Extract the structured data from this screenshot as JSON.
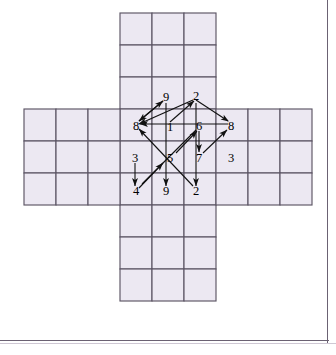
{
  "figure": {
    "name": "cube-net-with-arrows",
    "colors": {
      "cell_fill": "#ece8f2",
      "grid_line": "#5c5564",
      "arrow": "#111111",
      "frame": "#6b6273",
      "background": "#ffffff"
    },
    "grid": {
      "cell_size": 32,
      "origin_x": 24,
      "origin_y": 13,
      "layout_note": "plus/cross shape: 3-wide vertical arm of 9 rows, 9-wide horizontal band of 3 rows",
      "vertical_arm": {
        "cols": 3,
        "rows": 9,
        "col_start": 3,
        "row_start": 0
      },
      "horizontal_arm": {
        "cols": 9,
        "rows": 3,
        "col_start": 0,
        "row_start": 3
      }
    },
    "labels": [
      {
        "id": "label-9-top",
        "text": "9",
        "x": 166,
        "y": 97
      },
      {
        "id": "label-2-top",
        "text": "2",
        "x": 196,
        "y": 96
      },
      {
        "id": "label-8-left",
        "text": "8",
        "x": 136,
        "y": 126
      },
      {
        "id": "label-1-center",
        "text": "1",
        "x": 170,
        "y": 127
      },
      {
        "id": "label-6-center",
        "text": "6",
        "x": 199,
        "y": 126
      },
      {
        "id": "label-8-right",
        "text": "8",
        "x": 231,
        "y": 126
      },
      {
        "id": "label-3-left",
        "text": "3",
        "x": 135,
        "y": 158
      },
      {
        "id": "label-5-center",
        "text": "5",
        "x": 170,
        "y": 158
      },
      {
        "id": "label-7-center",
        "text": "7",
        "x": 199,
        "y": 158
      },
      {
        "id": "label-3-right",
        "text": "3",
        "x": 231,
        "y": 158
      },
      {
        "id": "label-4-bottom",
        "text": "4",
        "x": 136,
        "y": 191
      },
      {
        "id": "label-9-bottom",
        "text": "9",
        "x": 166,
        "y": 191
      },
      {
        "id": "label-2-bottom",
        "text": "2",
        "x": 196,
        "y": 191
      }
    ],
    "arrows": [
      {
        "id": "arrow-8-to-9",
        "from": [
          139,
          121
        ],
        "to": [
          163,
          101
        ],
        "head": "to"
      },
      {
        "id": "arrow-9-to-8",
        "from": [
          163,
          101
        ],
        "to": [
          139,
          121
        ],
        "head": "to"
      },
      {
        "id": "arrow-2-to-8left",
        "from": [
          193,
          100
        ],
        "to": [
          139,
          124
        ],
        "head": "to"
      },
      {
        "id": "arrow-1-to-2",
        "from": [
          170,
          122
        ],
        "to": [
          194,
          101
        ],
        "head": "to"
      },
      {
        "id": "arrow-8r-to-2",
        "from": [
          228,
          121
        ],
        "to": [
          196,
          100
        ],
        "head": "from"
      },
      {
        "id": "arrow-8left-1-6-8r",
        "from": [
          228,
          124
        ],
        "to": [
          140,
          124
        ],
        "head": "to"
      },
      {
        "id": "arrow-9top-down-9b",
        "from": [
          166,
          103
        ],
        "to": [
          166,
          186
        ],
        "head": "to"
      },
      {
        "id": "arrow-2top-down-2b",
        "from": [
          196,
          103
        ],
        "to": [
          196,
          186
        ],
        "head": "to"
      },
      {
        "id": "arrow-6-down-7",
        "from": [
          199,
          131
        ],
        "to": [
          199,
          152
        ],
        "head": "to"
      },
      {
        "id": "arrow-3-down-4",
        "from": [
          135,
          163
        ],
        "to": [
          135,
          186
        ],
        "head": "to"
      },
      {
        "id": "arrow-5-to-6",
        "from": [
          176,
          153
        ],
        "to": [
          197,
          131
        ],
        "head": "to"
      },
      {
        "id": "arrow-7-to-8right",
        "from": [
          203,
          153
        ],
        "to": [
          227,
          130
        ],
        "head": "to"
      },
      {
        "id": "arrow-4-to-3area",
        "from": [
          139,
          188
        ],
        "to": [
          163,
          163
        ],
        "head": "to"
      },
      {
        "id": "arrow-2b-to-8left",
        "from": [
          193,
          186
        ],
        "to": [
          139,
          129
        ],
        "head": "to"
      },
      {
        "id": "arrow-6-to-5-diag",
        "from": [
          196,
          130
        ],
        "to": [
          142,
          184
        ],
        "head": "none"
      }
    ]
  }
}
